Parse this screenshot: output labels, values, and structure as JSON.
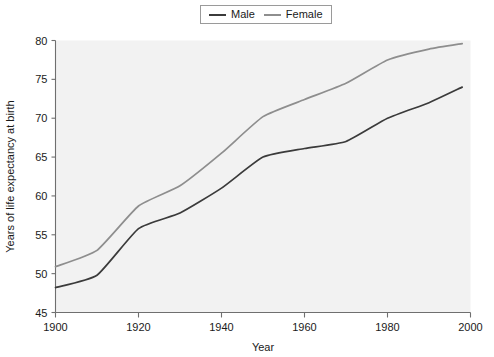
{
  "chart_data": {
    "type": "line",
    "title": "",
    "xlabel": "Year",
    "ylabel": "Years of life expectancy at birth",
    "xlim": [
      1900,
      2000
    ],
    "ylim": [
      45,
      80
    ],
    "xticks": [
      1900,
      1920,
      1940,
      1960,
      1980,
      2000
    ],
    "xticklabels": [
      "1900",
      "1920",
      "1940",
      "1960",
      "1980",
      "2000"
    ],
    "yticks": [
      45,
      50,
      55,
      60,
      65,
      70,
      75,
      80
    ],
    "yticklabels": [
      "45",
      "50",
      "55",
      "60",
      "65",
      "70",
      "75",
      "80"
    ],
    "grid": false,
    "legend_position": "top-center",
    "x": [
      1900,
      1910,
      1920,
      1930,
      1940,
      1950,
      1960,
      1970,
      1980,
      1990,
      1998
    ],
    "series": [
      {
        "name": "Male",
        "color": "#3b3b3b",
        "values": [
          48.2,
          49.8,
          55.8,
          57.8,
          61.0,
          65.0,
          66.1,
          67.0,
          70.0,
          72.0,
          74.0
        ]
      },
      {
        "name": "Female",
        "color": "#8e8e8e",
        "values": [
          50.9,
          53.0,
          58.7,
          61.3,
          65.5,
          70.2,
          72.4,
          74.5,
          77.5,
          78.9,
          79.6
        ]
      }
    ]
  },
  "legend": {
    "items": [
      {
        "label": "Male"
      },
      {
        "label": "Female"
      }
    ]
  },
  "colors": {
    "male_line": "#3b3b3b",
    "female_line": "#8e8e8e",
    "plot_background": "#f2f2f2",
    "axis": "#6f6f6f",
    "text": "#1a1a1a"
  }
}
